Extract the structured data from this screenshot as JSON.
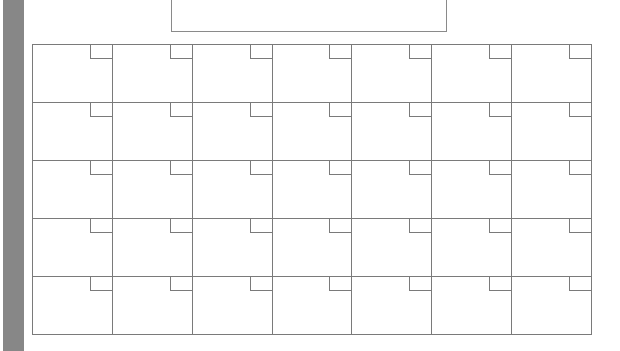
{
  "page": {
    "type": "blank monthly calendar template",
    "title": "",
    "side_bar_color": "#878787",
    "line_color": "#7a7a7a"
  },
  "calendar": {
    "columns": 7,
    "rows": 5,
    "cells": [
      [
        "",
        "",
        "",
        "",
        "",
        "",
        ""
      ],
      [
        "",
        "",
        "",
        "",
        "",
        "",
        ""
      ],
      [
        "",
        "",
        "",
        "",
        "",
        "",
        ""
      ],
      [
        "",
        "",
        "",
        "",
        "",
        "",
        ""
      ],
      [
        "",
        "",
        "",
        "",
        "",
        "",
        ""
      ]
    ]
  }
}
